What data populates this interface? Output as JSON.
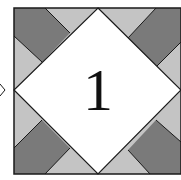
{
  "block": {
    "number_label": "1",
    "colors": {
      "background": "#ffffff",
      "light_patch": "#c4c4c4",
      "dark_patch": "#7a7a7a",
      "center_diamond": "#ffffff",
      "outline": "#1a1a1a"
    }
  }
}
